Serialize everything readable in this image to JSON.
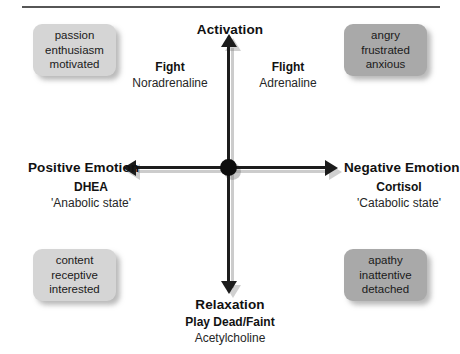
{
  "diagram": {
    "axes": {
      "vertical_top": "Activation",
      "vertical_bottom": "Relaxation",
      "horizontal_left": "Positive Emotion",
      "horizontal_right": "Negative Emotion"
    },
    "axis_labels": [
      {
        "name": "fight",
        "title": "Fight",
        "sub": "Noradrenaline"
      },
      {
        "name": "flight",
        "title": "Flight",
        "sub": "Adrenaline"
      },
      {
        "name": "dhea",
        "title": "DHEA",
        "sub": "'Anabolic state'"
      },
      {
        "name": "cortisol",
        "title": "Cortisol",
        "sub": "'Catabolic state'"
      },
      {
        "name": "play-dead-faint",
        "title": "Play Dead/Faint",
        "sub": "Acetylcholine"
      }
    ],
    "quadrant_boxes": [
      {
        "name": "activated-positive",
        "position": "top-left",
        "shade": "#d5d5d5",
        "lines": [
          "passion",
          "enthusiasm",
          "motivated"
        ]
      },
      {
        "name": "activated-negative",
        "position": "top-right",
        "shade": "#a9a9a9",
        "lines": [
          "angry",
          "frustrated",
          "anxious"
        ]
      },
      {
        "name": "relaxed-positive",
        "position": "bottom-left",
        "shade": "#d5d5d5",
        "lines": [
          "content",
          "receptive",
          "interested"
        ]
      },
      {
        "name": "relaxed-negative",
        "position": "bottom-right",
        "shade": "#a9a9a9",
        "lines": [
          "apathy",
          "inattentive",
          "detached"
        ]
      }
    ],
    "colors": {
      "axis": "#1c1c1c",
      "rule": "#565656",
      "box_light": "#d5d5d5",
      "box_dark": "#a9a9a9",
      "text": "#121212"
    }
  }
}
